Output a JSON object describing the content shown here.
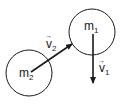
{
  "diagram": {
    "colors": {
      "stroke": "#1a1a1a",
      "background": "#ffffff"
    },
    "masses": [
      {
        "id": "m1",
        "label": "m",
        "subscript": "1",
        "cx": 92,
        "cy": 32,
        "r": 23
      },
      {
        "id": "m2",
        "label": "m",
        "subscript": "2",
        "cx": 29,
        "cy": 73,
        "r": 23
      }
    ],
    "vectors": [
      {
        "id": "v1",
        "label": "v",
        "subscript": "1",
        "arrow_symbol": "→",
        "x1": 93,
        "y1": 34,
        "x2": 93,
        "y2": 83
      },
      {
        "id": "v2",
        "label": "v",
        "subscript": "2",
        "arrow_symbol": "→",
        "x1": 31,
        "y1": 72,
        "x2": 72,
        "y2": 44
      }
    ]
  }
}
